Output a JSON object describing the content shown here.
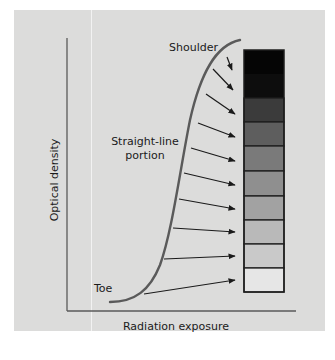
{
  "diagram": {
    "type": "characteristic-curve",
    "axes": {
      "x_label": "Radiation exposure",
      "y_label": "Optical density"
    },
    "curve_labels": {
      "shoulder": "Shoulder",
      "straight_line_1": "Straight-line",
      "straight_line_2": "portion",
      "toe": "Toe"
    },
    "colors": {
      "background": "#dcdcdb",
      "curve": "#5a5a5a",
      "axis": "#5a5a5a",
      "arrow": "#1a1a1a",
      "wedge_border": "#1e1e1e"
    },
    "step_wedge": {
      "steps": [
        {
          "shade": "#050505"
        },
        {
          "shade": "#0d0d0d"
        },
        {
          "shade": "#3b3b3b"
        },
        {
          "shade": "#5e5e5e"
        },
        {
          "shade": "#7a7a7a"
        },
        {
          "shade": "#8f8f8f"
        },
        {
          "shade": "#a2a2a2"
        },
        {
          "shade": "#b9b9b9"
        },
        {
          "shade": "#c9c9c9"
        },
        {
          "shade": "#e6e6e6"
        }
      ]
    }
  }
}
